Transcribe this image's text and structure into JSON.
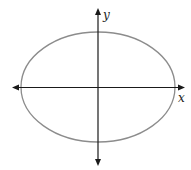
{
  "diagram": {
    "type": "ellipse-on-axes",
    "axes": {
      "x_label": "x",
      "y_label": "y",
      "color": "#1a1a1a"
    },
    "ellipse": {
      "stroke_color": "#8c8c8c"
    }
  }
}
